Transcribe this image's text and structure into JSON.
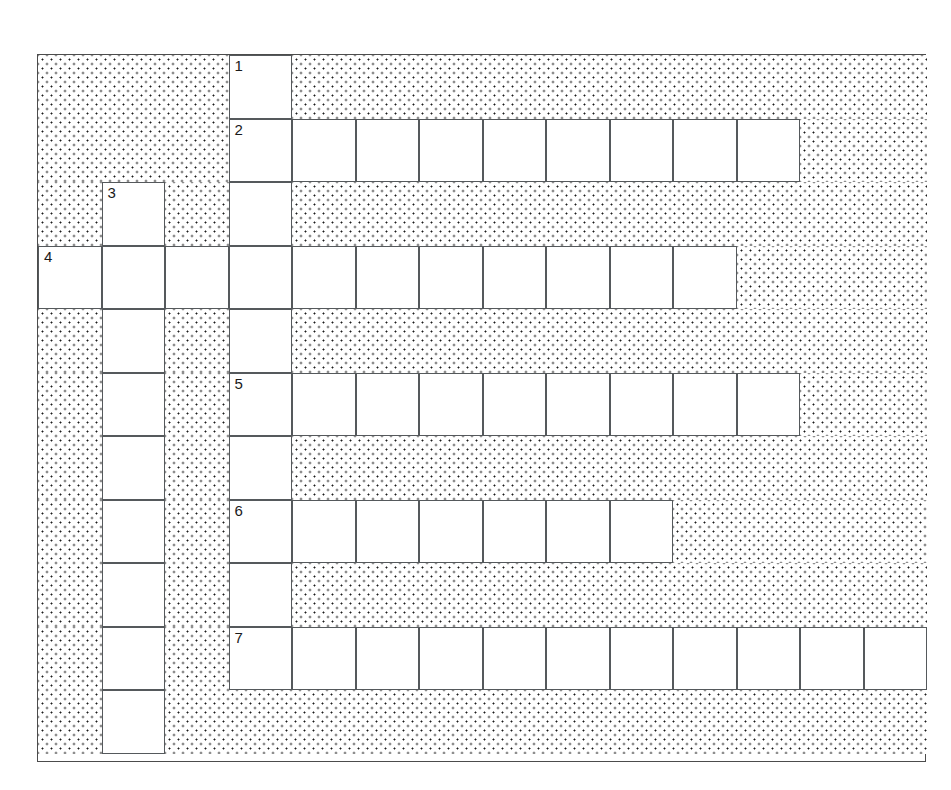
{
  "page": {
    "background_color": "#ffffff"
  },
  "grid": {
    "columns": 14,
    "rows": 11,
    "cell_size": 63.5,
    "origin_x": 37,
    "origin_y": 54,
    "border_color": "#4c4c4c",
    "cell_border_color": "#55595c",
    "block_pattern": "dotted-stipple",
    "block_dot_color": "#1c1c1c",
    "cell_fill_color": "#ffffff"
  },
  "blocks": [
    {
      "name": "block-top-left",
      "col": 1,
      "row": 1,
      "cols": 3,
      "rows": 3
    },
    {
      "name": "block-top-right",
      "col": 5,
      "row": 1,
      "cols": 10,
      "rows": 1
    },
    {
      "name": "block-row2-right",
      "col": 13,
      "row": 2,
      "cols": 2,
      "rows": 1
    },
    {
      "name": "block-row3-right",
      "col": 5,
      "row": 3,
      "cols": 10,
      "rows": 1
    },
    {
      "name": "block-row3-col1",
      "col": 1,
      "row": 3,
      "cols": 1,
      "rows": 1
    },
    {
      "name": "block-row3-col3",
      "col": 3,
      "row": 3,
      "cols": 1,
      "rows": 1
    },
    {
      "name": "block-row4-right",
      "col": 12,
      "row": 4,
      "cols": 3,
      "rows": 1
    },
    {
      "name": "block-row5-col1",
      "col": 1,
      "row": 5,
      "cols": 1,
      "rows": 1
    },
    {
      "name": "block-row5-col3",
      "col": 3,
      "row": 5,
      "cols": 1,
      "rows": 1
    },
    {
      "name": "block-row5-right",
      "col": 5,
      "row": 5,
      "cols": 10,
      "rows": 1
    },
    {
      "name": "block-row6-right",
      "col": 13,
      "row": 6,
      "cols": 2,
      "rows": 1
    },
    {
      "name": "block-row6-col1",
      "col": 1,
      "row": 6,
      "cols": 1,
      "rows": 1
    },
    {
      "name": "block-row6-col3",
      "col": 3,
      "row": 6,
      "cols": 1,
      "rows": 1
    },
    {
      "name": "block-row7-col1",
      "col": 1,
      "row": 7,
      "cols": 1,
      "rows": 1
    },
    {
      "name": "block-row7-col3",
      "col": 3,
      "row": 7,
      "cols": 1,
      "rows": 1
    },
    {
      "name": "block-row7-right",
      "col": 5,
      "row": 7,
      "cols": 10,
      "rows": 1
    },
    {
      "name": "block-row8-col1",
      "col": 1,
      "row": 8,
      "cols": 1,
      "rows": 1
    },
    {
      "name": "block-row8-col3",
      "col": 3,
      "row": 8,
      "cols": 1,
      "rows": 1
    },
    {
      "name": "block-row8-right",
      "col": 11,
      "row": 8,
      "cols": 4,
      "rows": 1
    },
    {
      "name": "block-row9-col1",
      "col": 1,
      "row": 9,
      "cols": 1,
      "rows": 1
    },
    {
      "name": "block-row9-col3",
      "col": 3,
      "row": 9,
      "cols": 1,
      "rows": 1
    },
    {
      "name": "block-row9-right",
      "col": 5,
      "row": 9,
      "cols": 10,
      "rows": 1
    },
    {
      "name": "block-row10-col1",
      "col": 1,
      "row": 10,
      "cols": 1,
      "rows": 1
    },
    {
      "name": "block-row10-col3",
      "col": 3,
      "row": 10,
      "cols": 1,
      "rows": 1
    },
    {
      "name": "block-row11-col1",
      "col": 1,
      "row": 11,
      "cols": 1,
      "rows": 1
    },
    {
      "name": "block-row11-right",
      "col": 3,
      "row": 11,
      "cols": 12,
      "rows": 1
    }
  ],
  "entries": [
    {
      "number": "1",
      "name": "entry-1-down",
      "direction": "down",
      "col": 4,
      "row": 1,
      "length": 10,
      "letters": [
        "",
        "",
        "",
        "",
        "",
        "",
        "",
        "",
        "",
        ""
      ]
    },
    {
      "number": "2",
      "name": "entry-2-across",
      "direction": "across",
      "col": 4,
      "row": 2,
      "length": 9,
      "letters": [
        "",
        "",
        "",
        "",
        "",
        "",
        "",
        "",
        ""
      ]
    },
    {
      "number": "3",
      "name": "entry-3-down",
      "direction": "down",
      "col": 2,
      "row": 3,
      "length": 9,
      "letters": [
        "",
        "",
        "",
        "",
        "",
        "",
        "",
        "",
        ""
      ]
    },
    {
      "number": "4",
      "name": "entry-4-across",
      "direction": "across",
      "col": 1,
      "row": 4,
      "length": 11,
      "letters": [
        "",
        "",
        "",
        "",
        "",
        "",
        "",
        "",
        "",
        "",
        ""
      ]
    },
    {
      "number": "5",
      "name": "entry-5-across",
      "direction": "across",
      "col": 4,
      "row": 6,
      "length": 9,
      "letters": [
        "",
        "",
        "",
        "",
        "",
        "",
        "",
        "",
        ""
      ]
    },
    {
      "number": "6",
      "name": "entry-6-across",
      "direction": "across",
      "col": 4,
      "row": 8,
      "length": 7,
      "letters": [
        "",
        "",
        "",
        "",
        "",
        "",
        ""
      ]
    },
    {
      "number": "7",
      "name": "entry-7-across",
      "direction": "across",
      "col": 4,
      "row": 10,
      "length": 11,
      "letters": [
        "",
        "",
        "",
        "",
        "",
        "",
        "",
        "",
        "",
        "",
        ""
      ]
    }
  ],
  "numbered_cells": [
    {
      "label": "1",
      "col": 4,
      "row": 1
    },
    {
      "label": "2",
      "col": 4,
      "row": 2
    },
    {
      "label": "3",
      "col": 2,
      "row": 3
    },
    {
      "label": "4",
      "col": 1,
      "row": 4
    },
    {
      "label": "5",
      "col": 4,
      "row": 6
    },
    {
      "label": "6",
      "col": 4,
      "row": 8
    },
    {
      "label": "7",
      "col": 4,
      "row": 10
    }
  ]
}
